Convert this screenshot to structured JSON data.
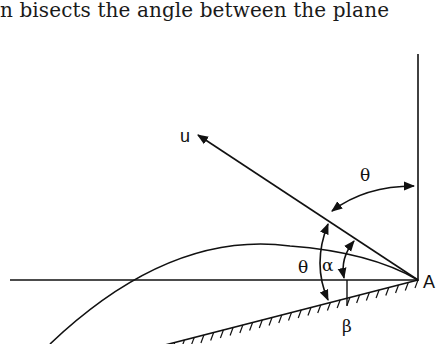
{
  "text": {
    "caption": "n bisects the angle between the plane"
  },
  "figure": {
    "labels": {
      "velocity": "u",
      "point": "A",
      "theta_top": "θ",
      "theta_left": "θ",
      "alpha": "α",
      "beta": "β"
    }
  }
}
